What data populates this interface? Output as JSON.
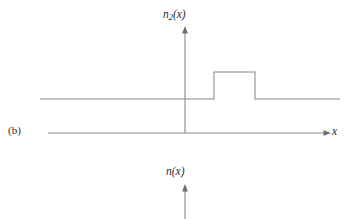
{
  "figure": {
    "panel_label": "(b)",
    "background_color": "#ffffff",
    "line_color": "#888888",
    "text_color": "#2b2b2b",
    "width": 347,
    "height": 219
  },
  "upper_plot": {
    "y_axis_title_base": "n",
    "y_axis_title_subscript": "2",
    "y_axis_title_arg": "(x)",
    "y_axis_title_full": "n2(x)",
    "x_axis_title": "x",
    "axis_origin_x": 185,
    "axis_x_baseline_y": 133,
    "axis_top_y": 28,
    "axis_left_x": 48,
    "axis_right_x": 330
  },
  "lower_plot": {
    "y_axis_title_base": "n",
    "y_axis_title_arg": "(x)",
    "y_axis_title_full": "n(x)",
    "axis_origin_x": 185,
    "axis_top_y": 186,
    "axis_bottom_y": 219
  },
  "chart_data": {
    "type": "line",
    "title": "",
    "xlabel": "x",
    "ylabel": "n2(x)",
    "grid": false,
    "legend": false,
    "series": [
      {
        "name": "n2(x)",
        "comment": "step profile drawn as polyline in pixel coordinates of the figure",
        "points_px": [
          [
            40,
            99
          ],
          [
            214,
            99
          ],
          [
            214,
            72
          ],
          [
            255,
            72
          ],
          [
            255,
            99
          ],
          [
            340,
            99
          ]
        ],
        "baseline_level_px": 99,
        "step_top_level_px": 72,
        "step_start_px": 214,
        "step_end_px": 255
      }
    ],
    "levels": {
      "baseline": 1,
      "step_high": 2
    },
    "xlim_px": [
      40,
      340
    ],
    "ylim_px": [
      133,
      28
    ]
  }
}
